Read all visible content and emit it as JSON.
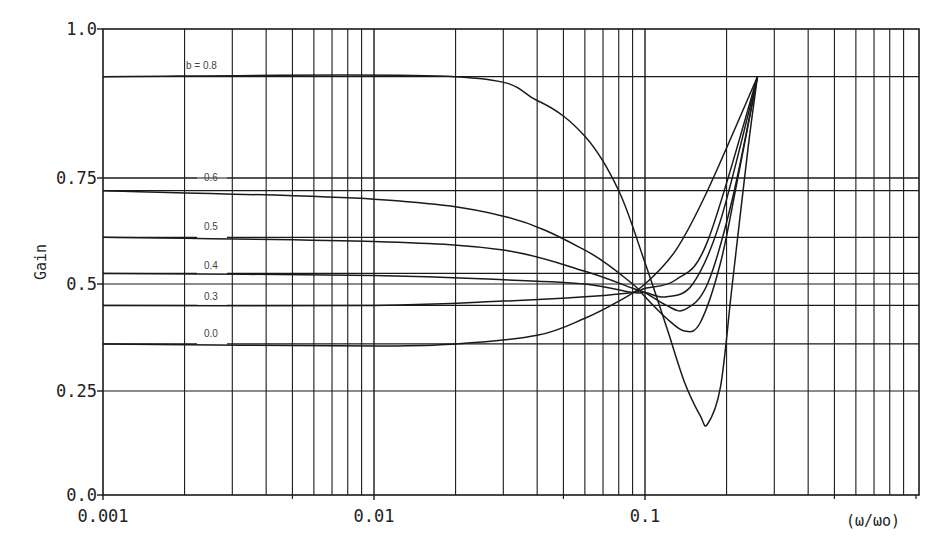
{
  "chart_data": {
    "type": "line",
    "title": "",
    "xlabel": "(ω/ωo)",
    "ylabel": "Gain",
    "xscale": "log",
    "xlim": [
      0.001,
      1.0
    ],
    "ylim": [
      0.0,
      1.0
    ],
    "grid": true,
    "x_tick_labels": [
      "0.001",
      "0.01",
      "0.1"
    ],
    "x_ticks": [
      0.001,
      0.01,
      0.1
    ],
    "y_tick_labels": [
      "0.0",
      "0.25",
      "0.5",
      "0.75",
      "1.0"
    ],
    "y_ticks": [
      0.0,
      0.25,
      0.5,
      0.75,
      1.0
    ],
    "legend": "inline curve labels",
    "reference_lines": [
      {
        "label": "b = 0.8",
        "y": 0.92
      },
      {
        "label": "0.6",
        "y": 0.75
      },
      {
        "label": "",
        "y": 0.72
      },
      {
        "label": "0.5",
        "y": 0.61
      },
      {
        "label": "0.4",
        "y": 0.525
      },
      {
        "label": "0.3",
        "y": 0.45
      },
      {
        "label": "0.0",
        "y": 0.36
      }
    ],
    "series": [
      {
        "name": "b = 0.8",
        "x": [
          0.001,
          0.02,
          0.04,
          0.06,
          0.08,
          0.1,
          0.12,
          0.14,
          0.16,
          0.17,
          0.19,
          0.21,
          0.24,
          0.26
        ],
        "y": [
          0.92,
          0.92,
          0.88,
          0.82,
          0.72,
          0.55,
          0.4,
          0.27,
          0.19,
          0.17,
          0.26,
          0.5,
          0.8,
          0.92
        ]
      },
      {
        "name": "0.6",
        "x": [
          0.001,
          0.01,
          0.03,
          0.06,
          0.09,
          0.1,
          0.12,
          0.14,
          0.16,
          0.19,
          0.22,
          0.26
        ],
        "y": [
          0.72,
          0.7,
          0.66,
          0.58,
          0.5,
          0.47,
          0.42,
          0.39,
          0.41,
          0.55,
          0.75,
          0.92
        ]
      },
      {
        "name": "0.5",
        "x": [
          0.001,
          0.01,
          0.03,
          0.06,
          0.09,
          0.1,
          0.12,
          0.14,
          0.17,
          0.21,
          0.26
        ],
        "y": [
          0.61,
          0.6,
          0.58,
          0.53,
          0.49,
          0.48,
          0.45,
          0.44,
          0.5,
          0.7,
          0.92
        ]
      },
      {
        "name": "0.4",
        "x": [
          0.001,
          0.01,
          0.03,
          0.06,
          0.09,
          0.1,
          0.12,
          0.15,
          0.19,
          0.26
        ],
        "y": [
          0.525,
          0.52,
          0.51,
          0.5,
          0.48,
          0.48,
          0.47,
          0.5,
          0.65,
          0.92
        ]
      },
      {
        "name": "0.3",
        "x": [
          0.001,
          0.01,
          0.03,
          0.06,
          0.09,
          0.1,
          0.13,
          0.17,
          0.26
        ],
        "y": [
          0.45,
          0.45,
          0.46,
          0.47,
          0.48,
          0.49,
          0.51,
          0.6,
          0.92
        ]
      },
      {
        "name": "0.0",
        "x": [
          0.001,
          0.01,
          0.02,
          0.04,
          0.06,
          0.08,
          0.1,
          0.13,
          0.17,
          0.26
        ],
        "y": [
          0.36,
          0.355,
          0.36,
          0.38,
          0.42,
          0.46,
          0.5,
          0.58,
          0.72,
          0.92
        ]
      }
    ]
  },
  "colors": {
    "background": "#ffffff",
    "ink": "#1a1a1a"
  }
}
